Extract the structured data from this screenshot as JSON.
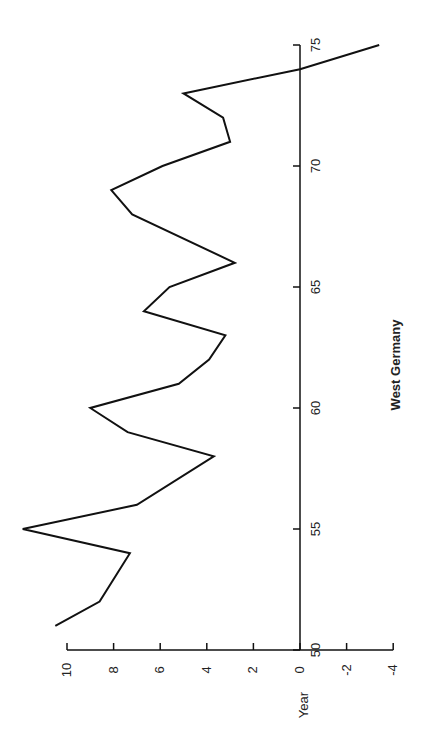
{
  "chart_data": {
    "type": "line",
    "orientation": "rotated-90-ccw",
    "title": "West Germany",
    "xlabel": "Year",
    "ylabel": "",
    "x": [
      51,
      52,
      54,
      55,
      56,
      58,
      59,
      60,
      61,
      62,
      63,
      64,
      65,
      66,
      68,
      69,
      70,
      71,
      72,
      73,
      74,
      75
    ],
    "series": [
      {
        "name": "West Germany",
        "values": [
          10.5,
          8.6,
          7.3,
          11.9,
          7.0,
          3.7,
          7.4,
          9.0,
          5.2,
          3.9,
          3.2,
          6.7,
          5.6,
          2.8,
          7.2,
          8.1,
          5.9,
          3.0,
          3.3,
          5.0,
          0.0,
          -3.4
        ]
      }
    ],
    "x_ticks": [
      "50",
      "55",
      "60",
      "65",
      "70",
      "75"
    ],
    "y_ticks": [
      "10",
      "8",
      "6",
      "4",
      "2",
      "0",
      "-2",
      "-4"
    ],
    "xlim": [
      50,
      75
    ],
    "ylim": [
      -4,
      10
    ],
    "grid": false,
    "legend": null
  },
  "labels": {
    "year_axis_label": "Year",
    "caption": "West Germany"
  }
}
